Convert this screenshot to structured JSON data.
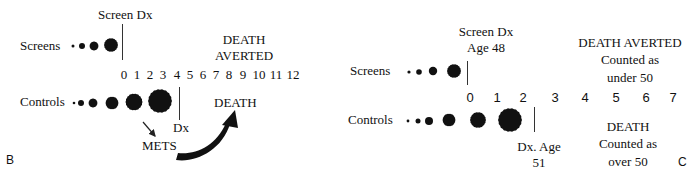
{
  "panel_b": {
    "panel_label": "B",
    "screens_label": "Screens",
    "controls_label": "Controls",
    "screen_dx_label": "Screen Dx",
    "death_averted_line1": "DEATH",
    "death_averted_line2": "AVERTED",
    "timeline_ticks": [
      "0",
      "1",
      "2",
      "3",
      "4",
      "5",
      "6",
      "7",
      "8",
      "9",
      "10",
      "11",
      "12"
    ],
    "dx_label": "Dx",
    "mets_label": "METS",
    "death_label": "DEATH"
  },
  "panel_c": {
    "panel_label": "C",
    "screens_label": "Screens",
    "controls_label": "Controls",
    "screen_dx_line1": "Screen Dx",
    "screen_dx_line2": "Age 48",
    "death_averted_title": "DEATH  AVERTED",
    "death_averted_line2": "Counted as",
    "death_averted_line3": "under 50",
    "timeline_ticks": [
      "0",
      "1",
      "2",
      "3",
      "4",
      "5",
      "6",
      "7"
    ],
    "dx_line1": "Dx. Age",
    "dx_line2": "51",
    "death_title": "DEATH",
    "death_line2": "Counted  as",
    "death_line3": "over 50"
  },
  "colors": {
    "ink": "#111111",
    "background": "#ffffff"
  }
}
